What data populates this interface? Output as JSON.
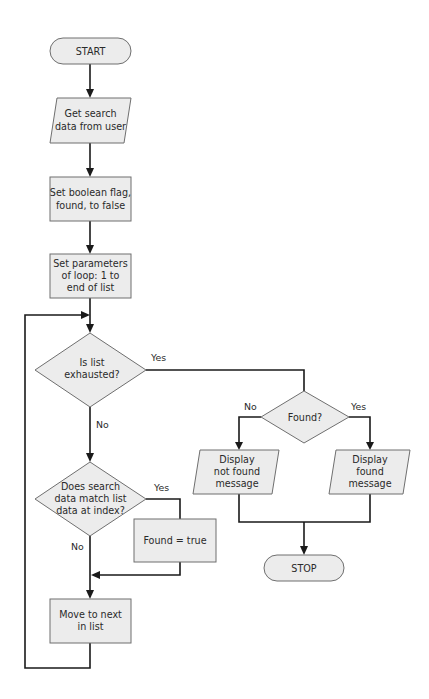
{
  "diagram": {
    "type": "flowchart",
    "colors": {
      "fill": "#ececec",
      "stroke": "#6f6f6f",
      "connector": "#1a1a1a",
      "text": "#2a2a2a"
    },
    "nodes": {
      "start": {
        "shape": "terminal",
        "lines": [
          "START"
        ]
      },
      "get_data": {
        "shape": "io",
        "lines": [
          "Get search",
          "data from user"
        ]
      },
      "set_flag": {
        "shape": "process",
        "lines": [
          "Set boolean flag,",
          "found, to false"
        ]
      },
      "set_loop": {
        "shape": "process",
        "lines": [
          "Set parameters",
          "of loop: 1 to",
          "end of list"
        ]
      },
      "exhausted": {
        "shape": "decision",
        "lines": [
          "Is list",
          "exhausted?"
        ]
      },
      "match": {
        "shape": "decision",
        "lines": [
          "Does search",
          "data match list",
          "data at index?"
        ]
      },
      "found_true": {
        "shape": "process",
        "lines": [
          "Found = true"
        ]
      },
      "move_next": {
        "shape": "process",
        "lines": [
          "Move to next",
          "in list"
        ]
      },
      "found_q": {
        "shape": "decision",
        "lines": [
          "Found?"
        ]
      },
      "not_found_msg": {
        "shape": "io",
        "lines": [
          "Display",
          "not found",
          "message"
        ]
      },
      "found_msg": {
        "shape": "io",
        "lines": [
          "Display",
          "found",
          "message"
        ]
      },
      "stop": {
        "shape": "terminal",
        "lines": [
          "STOP"
        ]
      }
    },
    "edge_labels": {
      "exhausted_yes": "Yes",
      "exhausted_no": "No",
      "match_yes": "Yes",
      "match_no": "No",
      "found_no": "No",
      "found_yes": "Yes"
    },
    "edges": [
      {
        "from": "start",
        "to": "get_data"
      },
      {
        "from": "get_data",
        "to": "set_flag"
      },
      {
        "from": "set_flag",
        "to": "set_loop"
      },
      {
        "from": "set_loop",
        "to": "exhausted"
      },
      {
        "from": "exhausted",
        "to": "found_q",
        "label": "Yes"
      },
      {
        "from": "exhausted",
        "to": "match",
        "label": "No"
      },
      {
        "from": "match",
        "to": "found_true",
        "label": "Yes"
      },
      {
        "from": "match",
        "to": "move_next",
        "label": "No"
      },
      {
        "from": "found_true",
        "to": "move_next"
      },
      {
        "from": "move_next",
        "to": "exhausted"
      },
      {
        "from": "found_q",
        "to": "not_found_msg",
        "label": "No"
      },
      {
        "from": "found_q",
        "to": "found_msg",
        "label": "Yes"
      },
      {
        "from": "not_found_msg",
        "to": "stop"
      },
      {
        "from": "found_msg",
        "to": "stop"
      }
    ]
  }
}
